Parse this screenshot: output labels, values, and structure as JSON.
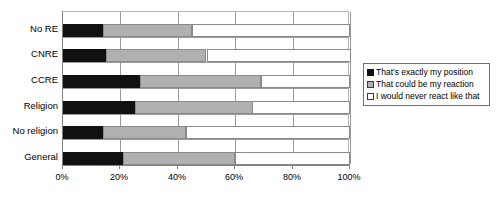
{
  "chart_data": {
    "type": "bar",
    "orientation": "horizontal",
    "stacked": true,
    "normalized_percent": true,
    "title": "",
    "xlabel": "",
    "ylabel": "",
    "xlim": [
      0,
      100
    ],
    "grid": true,
    "legend_position": "right",
    "categories": [
      "No RE",
      "CNRE",
      "CCRE",
      "Religion",
      "No religion",
      "General"
    ],
    "tick_labels": [
      "0%",
      "20%",
      "40%",
      "60%",
      "80%",
      "100%"
    ],
    "tick_values": [
      0,
      20,
      40,
      60,
      80,
      100
    ],
    "series": [
      {
        "name": "That's exactly my position",
        "color": "#111111",
        "values": [
          14,
          15,
          27,
          25,
          14,
          21
        ]
      },
      {
        "name": "That could be my reaction",
        "color": "#b0b0b0",
        "values": [
          31,
          35,
          42,
          41,
          29,
          39
        ]
      },
      {
        "name": "I would never react like that",
        "color": "#ffffff",
        "values": [
          55,
          50,
          31,
          34,
          57,
          40
        ]
      }
    ]
  },
  "legend": {
    "items": [
      {
        "label": "That's exactly my position",
        "swatch": "black-filled-square"
      },
      {
        "label": "That could be my reaction",
        "swatch": "gray-filled-square"
      },
      {
        "label": "I would never react like that",
        "swatch": "white-outlined-square"
      }
    ]
  }
}
